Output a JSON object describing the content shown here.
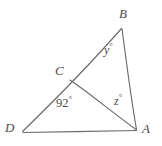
{
  "figure": {
    "type": "geometry-diagram",
    "background_color": "#ffffff",
    "stroke_color": "#6b6b6b",
    "text_color": "#4a4a4a",
    "vertices": [
      {
        "id": "B",
        "label": "B",
        "x": 122,
        "y": 28
      },
      {
        "id": "C",
        "label": "C",
        "x": 70,
        "y": 80
      },
      {
        "id": "D",
        "label": "D",
        "x": 22,
        "y": 132
      },
      {
        "id": "A",
        "label": "A",
        "x": 137,
        "y": 130
      }
    ],
    "segments": [
      {
        "from": "D",
        "to": "B"
      },
      {
        "from": "B",
        "to": "A"
      },
      {
        "from": "D",
        "to": "A"
      },
      {
        "from": "C",
        "to": "A"
      }
    ],
    "angles": [
      {
        "id": "y",
        "at": "B",
        "value": "y",
        "degree_symbol": "°"
      },
      {
        "id": "z",
        "at": "A",
        "value": "z",
        "degree_symbol": "°"
      },
      {
        "id": "angle-92",
        "at": "C",
        "value": "92",
        "degree_symbol": "°"
      }
    ]
  },
  "labels": {
    "vertex_b": "B",
    "vertex_c": "C",
    "vertex_d": "D",
    "vertex_a": "A",
    "angle_y": "y",
    "angle_z": "z",
    "angle_92": "92",
    "degree": "°"
  }
}
